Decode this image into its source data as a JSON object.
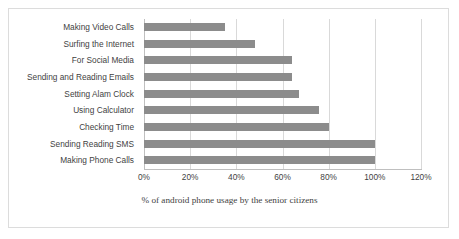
{
  "chart_data": {
    "type": "bar",
    "orientation": "horizontal",
    "title": "",
    "xlabel": "% of android phone usage by the senior citizens",
    "ylabel": "",
    "xlim": [
      0,
      120
    ],
    "xticks": [
      0,
      20,
      40,
      60,
      80,
      100,
      120
    ],
    "xtick_labels": [
      "0%",
      "20%",
      "40%",
      "60%",
      "80%",
      "100%",
      "120%"
    ],
    "grid": true,
    "legend": false,
    "bar_color": "#8c8c8c",
    "categories": [
      "Making Video Calls",
      "Surfing the Internet",
      "For Social Media",
      "Sending and Reading Emails",
      "Setting Alam Clock",
      "Using Calculator",
      "Checking Time",
      "Sending Reading SMS",
      "Making Phone Calls"
    ],
    "values": [
      35,
      48,
      64,
      64,
      67,
      76,
      80,
      100,
      100
    ]
  }
}
